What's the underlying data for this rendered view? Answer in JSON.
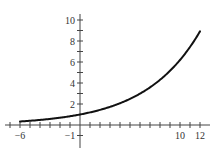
{
  "chart_data": {
    "type": "line",
    "title": "",
    "xlabel": "",
    "ylabel": "",
    "function": "y = 1.2^x",
    "xlim": [
      -7,
      13
    ],
    "ylim": [
      -1.5,
      11
    ],
    "grid": false,
    "legend": null,
    "x_tick_labels": [
      "-6",
      "-1",
      "10",
      "12"
    ],
    "x_tick_label_values": [
      -6,
      -1,
      10,
      12
    ],
    "y_tick_labels": [
      "2",
      "4",
      "6",
      "8",
      "10"
    ],
    "y_tick_label_values": [
      2,
      4,
      6,
      8,
      10
    ],
    "x_minor_ticks_step": 1,
    "y_minor_ticks_step": 1,
    "series": [
      {
        "name": "curve",
        "color": "#111111",
        "x": [
          -6,
          -5,
          -4,
          -3,
          -2,
          -1,
          0,
          1,
          2,
          3,
          4,
          5,
          6,
          7,
          8,
          9,
          10,
          11,
          12
        ],
        "y": [
          0.33,
          0.4,
          0.48,
          0.58,
          0.69,
          0.83,
          1.0,
          1.2,
          1.44,
          1.73,
          2.07,
          2.49,
          2.99,
          3.58,
          4.3,
          5.16,
          6.19,
          7.43,
          8.92
        ]
      }
    ]
  },
  "colors": {
    "axis": "#444444",
    "curve": "#111111",
    "text": "#333333"
  }
}
